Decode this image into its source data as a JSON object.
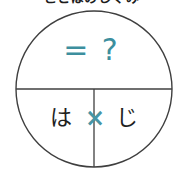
{
  "canvas": {
    "width": 183,
    "height": 179,
    "background_color": "#ffffff"
  },
  "clipped_heading": {
    "text": "ことばのしくみ",
    "note": "cut off at top edge of screenshot",
    "color": "#1c1c1c"
  },
  "diagram": {
    "shape": "circle",
    "center_x": 94,
    "center_y": 89,
    "radius": 78,
    "stroke_color": "#3f3f3f",
    "stroke_width": 1.4,
    "fill_color": "#ffffff",
    "horizontal_divider": {
      "name": "horizontal-diameter-line",
      "y": 89,
      "x1": 16,
      "x2": 172
    },
    "vertical_divider": {
      "name": "vertical-radius-line",
      "x": 94,
      "y1": 89,
      "y2": 167
    }
  },
  "labels": {
    "top_half": {
      "text": "= ?",
      "color": "#3d8f9e",
      "region": "upper-semicircle"
    },
    "bottom_left": {
      "text": "は",
      "color": "#1f1f1f",
      "region": "lower-left-quadrant"
    },
    "center_operator": {
      "text": "×",
      "color": "#4795a6",
      "region": "on-vertical-divider"
    },
    "bottom_right": {
      "text": "じ",
      "color": "#1f1f1f",
      "region": "lower-right-quadrant"
    }
  },
  "colors": {
    "accent_teal": "#3d8f9e",
    "operator_teal": "#4795a6",
    "ink": "#1f1f1f",
    "line": "#3f3f3f",
    "background": "#ffffff"
  }
}
